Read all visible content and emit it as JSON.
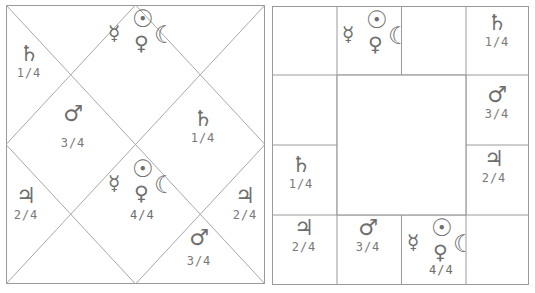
{
  "colors": {
    "line": "#9a9a9a",
    "text": "#7a7a7a",
    "background": "#ffffff"
  },
  "glyphs": {
    "saturn": "♄",
    "mars": "♂",
    "jupiter": "♃",
    "sun": "☉",
    "mercury": "☿",
    "venus": "♀",
    "moon": "☾"
  },
  "north_chart": {
    "type": "north-indian-diamond",
    "houses": [
      {
        "position": "top-center",
        "planets": [
          "sun",
          "mercury",
          "venus",
          "moon"
        ],
        "fraction": ""
      },
      {
        "position": "top-left",
        "planets": [
          "saturn"
        ],
        "fraction": "1/4"
      },
      {
        "position": "upper-left-inner",
        "planets": [
          "mars"
        ],
        "fraction": "3/4"
      },
      {
        "position": "upper-right-inner",
        "planets": [
          "saturn"
        ],
        "fraction": "1/4"
      },
      {
        "position": "left",
        "planets": [
          "jupiter"
        ],
        "fraction": "2/4"
      },
      {
        "position": "center",
        "planets": [
          "sun",
          "mercury",
          "venus",
          "moon"
        ],
        "fraction": "4/4"
      },
      {
        "position": "right",
        "planets": [
          "jupiter"
        ],
        "fraction": "2/4"
      },
      {
        "position": "bottom-right-inner",
        "planets": [
          "mars"
        ],
        "fraction": "3/4"
      }
    ],
    "labels": {
      "tl_saturn": "♄",
      "tl_frac": "1/4",
      "ul_mars": "♂",
      "ul_frac": "3/4",
      "ur_saturn": "♄",
      "ur_frac": "1/4",
      "l_jup": "♃",
      "l_frac": "2/4",
      "r_jup": "♃",
      "r_frac": "2/4",
      "br_mars": "♂",
      "br_frac": "3/4",
      "center_frac": "4/4"
    }
  },
  "south_chart": {
    "type": "south-indian-grid",
    "cells": [
      {
        "row": 0,
        "col": 1,
        "planets": [
          "sun",
          "mercury",
          "venus",
          "moon"
        ],
        "fraction": ""
      },
      {
        "row": 0,
        "col": 3,
        "planets": [
          "saturn"
        ],
        "fraction": "1/4"
      },
      {
        "row": 1,
        "col": 3,
        "planets": [
          "mars"
        ],
        "fraction": "3/4"
      },
      {
        "row": 2,
        "col": 0,
        "planets": [
          "saturn"
        ],
        "fraction": "1/4"
      },
      {
        "row": 2,
        "col": 3,
        "planets": [
          "jupiter"
        ],
        "fraction": "2/4"
      },
      {
        "row": 3,
        "col": 0,
        "planets": [
          "jupiter"
        ],
        "fraction": "2/4"
      },
      {
        "row": 3,
        "col": 1,
        "planets": [
          "mars"
        ],
        "fraction": "3/4"
      },
      {
        "row": 3,
        "col": 2,
        "planets": [
          "sun",
          "mercury",
          "venus",
          "moon"
        ],
        "fraction": "4/4"
      }
    ],
    "labels": {
      "r0c3_saturn": "♄",
      "r0c3_frac": "1/4",
      "r1c3_mars": "♂",
      "r1c3_frac": "3/4",
      "r2c0_saturn": "♄",
      "r2c0_frac": "1/4",
      "r2c3_jup": "♃",
      "r2c3_frac": "2/4",
      "r3c0_jup": "♃",
      "r3c0_frac": "2/4",
      "r3c1_mars": "♂",
      "r3c1_frac": "3/4",
      "r3c2_frac": "4/4"
    }
  }
}
